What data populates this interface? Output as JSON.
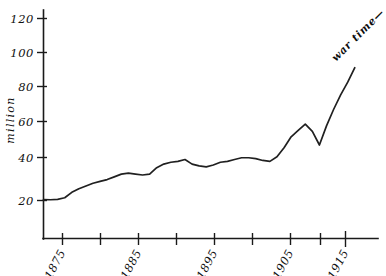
{
  "chart_data": {
    "type": "line",
    "title": "",
    "subtitle": "",
    "xlabel": "",
    "ylabel": "million",
    "xlim": [
      1870,
      1918
    ],
    "ylim": [
      0,
      128
    ],
    "grid": false,
    "legend": null,
    "y_ticks": [
      20,
      40,
      60,
      80,
      100,
      120
    ],
    "y_tick_labels": [
      "20",
      "40",
      "60",
      "80",
      "100",
      "120"
    ],
    "x_ticks": [
      1875,
      1880,
      1885,
      1890,
      1895,
      1900,
      1905,
      1910,
      1915
    ],
    "x_tick_labels": [
      "1875",
      "",
      "1885",
      "",
      "1895",
      "",
      "1905",
      "",
      "1915"
    ],
    "x_labeled_ticks": [
      "1875",
      "1885",
      "1895",
      "1905",
      "1915"
    ],
    "series": [
      {
        "name": "million",
        "x": [
          1870.5,
          1871.5,
          1872.5,
          1873.5,
          1874.5,
          1875.5,
          1876.5,
          1877.5,
          1878.5,
          1879.5,
          1880.5,
          1881.5,
          1882.5,
          1883.5,
          1884.5,
          1885.5,
          1886.5,
          1887.5,
          1888.5,
          1889.5,
          1890.5,
          1891.5,
          1892.5,
          1893.5,
          1894.5,
          1895.5,
          1896.5,
          1897.5,
          1898.5,
          1899.5,
          1900.5,
          1901.5,
          1902.5,
          1903.5,
          1904.5,
          1905.5,
          1906.5,
          1907.5,
          1908.5,
          1909.5,
          1910.5,
          1911.5,
          1912.5,
          1913.5,
          1914.5
        ],
        "values": [
          20.5,
          20.4,
          20.6,
          21.5,
          24.5,
          26.5,
          28.0,
          29.5,
          30.5,
          31.5,
          33.0,
          34.5,
          35.0,
          34.5,
          34.0,
          34.5,
          38.0,
          40.0,
          41.0,
          41.5,
          42.5,
          40.0,
          39.0,
          38.5,
          39.5,
          41.0,
          41.5,
          42.5,
          43.5,
          43.5,
          43.0,
          42.0,
          41.5,
          44.0,
          49.0,
          55.0,
          58.5,
          62.0,
          58.0,
          50.5,
          61.0,
          70.0,
          78.0,
          85.0,
          93.0
        ]
      }
    ],
    "annotations": [
      {
        "text": "war time—",
        "angle": -45,
        "anchor_year": 1915,
        "anchor_value": 100
      }
    ]
  },
  "axis": {
    "y_label_text": "million"
  },
  "figure": {
    "background_color": "#ffffff",
    "line_color": "#202020",
    "axis_color": "#1a1a1a"
  }
}
